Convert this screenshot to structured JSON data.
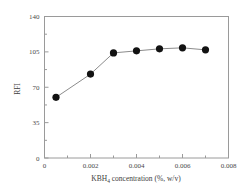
{
  "chart_data": {
    "type": "line",
    "title": "",
    "xlabel": "KBH4 concentration (%, w/v)",
    "xlabel_parts": {
      "pre": "KBH",
      "subscript": "4",
      "post": " concentration (%, w/v)"
    },
    "ylabel": "RFI",
    "xlim": [
      0,
      0.008
    ],
    "ylim": [
      0,
      140
    ],
    "xticks": [
      0,
      0.002,
      0.004,
      0.006,
      0.008
    ],
    "xticklabels": [
      "0",
      "0.002",
      "0.004",
      "0.006",
      "0.008"
    ],
    "yticks": [
      0,
      35,
      70,
      105,
      140
    ],
    "yticklabels": [
      "0",
      "35",
      "70",
      "105",
      "140"
    ],
    "minor_xticks": [
      0.001,
      0.003,
      0.005,
      0.007
    ],
    "minor_yticks": [
      17.5,
      52.5,
      87.5,
      122.5
    ],
    "grid": false,
    "legend": null,
    "series": [
      {
        "name": "RFI",
        "marker": "filled-circle",
        "marker_color": "#121212",
        "line_color": "#8c8c8c",
        "x": [
          0.0005,
          0.002,
          0.003,
          0.004,
          0.005,
          0.006,
          0.007
        ],
        "y": [
          60,
          83,
          104,
          106,
          108,
          109,
          107
        ]
      }
    ]
  }
}
